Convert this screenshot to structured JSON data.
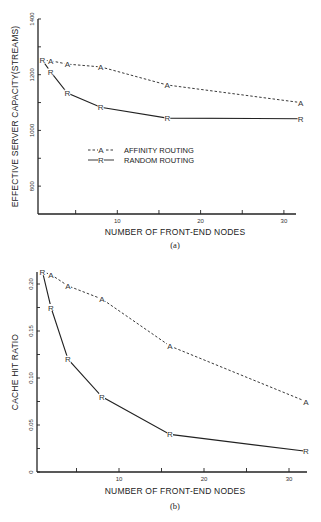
{
  "chart_data": [
    {
      "type": "line",
      "title": "",
      "caption": "(a)",
      "xlabel": "NUMBER OF FRONT-END NODES",
      "ylabel": "EFFECTIVE SERVER CAPACITY(STREAMS)",
      "xlim": [
        0.5,
        32.5
      ],
      "ylim": [
        700,
        1400
      ],
      "x_ticks": [
        5,
        10,
        15,
        20,
        25,
        30
      ],
      "x_tick_labels": [
        "",
        "10",
        "",
        "20",
        "",
        "30"
      ],
      "y_ticks": [
        800,
        900,
        1000,
        1100,
        1200,
        1300,
        1400
      ],
      "y_tick_labels": [
        "800",
        "",
        "1000",
        "",
        "1200",
        "",
        "1400"
      ],
      "grid": false,
      "legend_position": "center-left",
      "x": [
        1,
        2,
        4,
        8,
        16,
        32
      ],
      "series": [
        {
          "name": "AFFINITY ROUTING",
          "marker": "A",
          "style": "dashed",
          "values": [
            1252,
            1250,
            1238,
            1228,
            1163,
            1100
          ]
        },
        {
          "name": "RANDOM ROUTING",
          "marker": "R",
          "style": "solid",
          "values": [
            1252,
            1210,
            1134,
            1083,
            1044,
            1042
          ]
        }
      ]
    },
    {
      "type": "line",
      "title": "",
      "caption": "(b)",
      "xlabel": "NUMBER OF FRONT-END NODES",
      "ylabel": "CACHE HIT RATIO",
      "xlim": [
        0.5,
        32.5
      ],
      "ylim": [
        0,
        0.213
      ],
      "x_ticks": [
        5,
        10,
        15,
        20,
        25,
        30
      ],
      "x_tick_labels": [
        "",
        "10",
        "",
        "20",
        "",
        "30"
      ],
      "y_ticks": [
        0,
        0.025,
        0.05,
        0.075,
        0.1,
        0.125,
        0.15,
        0.175,
        0.2
      ],
      "y_tick_labels": [
        "0",
        "",
        "0.05",
        "",
        "0.10",
        "",
        "0.15",
        "",
        "0.20"
      ],
      "grid": false,
      "legend_position": "none",
      "x": [
        1,
        2,
        4,
        8,
        16,
        32
      ],
      "series": [
        {
          "name": "AFFINITY ROUTING",
          "marker": "A",
          "style": "dashed",
          "values": [
            0.213,
            0.21,
            0.198,
            0.184,
            0.134,
            0.075
          ]
        },
        {
          "name": "RANDOM ROUTING",
          "marker": "R",
          "style": "solid",
          "values": [
            0.213,
            0.175,
            0.12,
            0.08,
            0.04,
            0.022
          ]
        }
      ]
    }
  ],
  "colors": {
    "ink": "#222222",
    "background": "#ffffff"
  }
}
